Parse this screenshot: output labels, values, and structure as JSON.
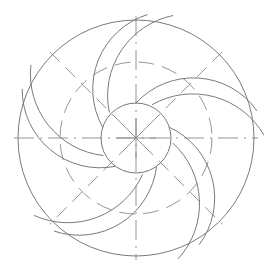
{
  "diagram": {
    "type": "impeller-blade-construction",
    "width": 264,
    "height": 275,
    "background": "#ffffff",
    "stroke_color": "#7a7a7a",
    "center_mark_color": "#8a8a8a",
    "center": {
      "x": 136,
      "y": 138
    },
    "outer_circle_radius": 118,
    "dashed_circle_radius": 76,
    "hub_circle_radius": 35,
    "blade_count": 5,
    "centerlines": [
      "horizontal",
      "vertical",
      "diagonal-45",
      "diagonal-135"
    ]
  }
}
